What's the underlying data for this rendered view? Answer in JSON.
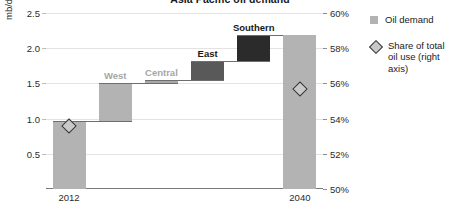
{
  "chart_data": {
    "type": "bar",
    "subtype": "waterfall",
    "title": "Asia Pacific oil demand",
    "ylabel": "mb/d",
    "y2label": "",
    "xlabel": "",
    "ylim": [
      0.0,
      2.5
    ],
    "y2lim": [
      50,
      60
    ],
    "y_ticks": [
      "0.5",
      "1.0",
      "1.5",
      "2.0",
      "2.5"
    ],
    "y_tick_values": [
      0.5,
      1.0,
      1.5,
      2.0,
      2.5
    ],
    "y2_ticks": [
      "50%",
      "52%",
      "54%",
      "56%",
      "58%",
      "60%"
    ],
    "y2_tick_values": [
      50,
      52,
      54,
      56,
      58,
      60
    ],
    "x_ticks": [
      "2012",
      "2040"
    ],
    "grid": true,
    "legend_position": "right",
    "categories": [
      "2012",
      "West",
      "Central",
      "East",
      "Southern",
      "2040"
    ],
    "values": [
      0.97,
      0.53,
      0.05,
      0.27,
      0.37,
      2.19
    ],
    "bars": [
      {
        "label": "2012",
        "label_shown": false,
        "base": 0.0,
        "top": 0.97,
        "color": "#b3b3b3",
        "label_color": "#2b2b2b",
        "total": true
      },
      {
        "label": "West",
        "label_shown": true,
        "base": 0.97,
        "top": 1.5,
        "color": "#b3b3b3",
        "label_color": "#a6a6a6",
        "total": false
      },
      {
        "label": "Central",
        "label_shown": true,
        "base": 1.5,
        "top": 1.55,
        "color": "#a8a8a8",
        "label_color": "#a6a6a6",
        "total": false
      },
      {
        "label": "East",
        "label_shown": true,
        "base": 1.55,
        "top": 1.82,
        "color": "#595959",
        "label_color": "#1a1a1a",
        "total": false
      },
      {
        "label": "Southern",
        "label_shown": true,
        "base": 1.82,
        "top": 2.19,
        "color": "#2b2b2b",
        "label_color": "#1a1a1a",
        "total": false
      },
      {
        "label": "2040",
        "label_shown": false,
        "base": 0.0,
        "top": 2.19,
        "color": "#b3b3b3",
        "label_color": "#2b2b2b",
        "total": true
      }
    ],
    "share_series": {
      "name": "Share of total oil use (right axis)",
      "points": [
        {
          "category": "2012",
          "value": 53.6
        },
        {
          "category": "2040",
          "value": 55.7
        }
      ]
    },
    "legend": [
      {
        "label": "Oil demand",
        "marker": "square",
        "color": "#b3b3b3"
      },
      {
        "label": "Share of total oil use (right axis)",
        "marker": "diamond",
        "color": "#c9c9c9"
      }
    ]
  }
}
